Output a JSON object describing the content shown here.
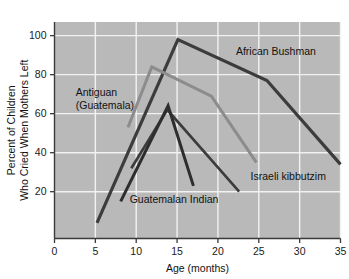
{
  "chart_data": {
    "type": "line",
    "title": "",
    "subtitle": "",
    "xlabel": "Age (months)",
    "ylabel": "Percent of Children\nWho Cried When Mothers Left",
    "ylabel_line1": "Percent of Children",
    "ylabel_line2": "Who Cried When Mothers Left",
    "xlim": [
      0,
      35
    ],
    "ylim": [
      -4,
      107
    ],
    "xticks": [
      0,
      5,
      10,
      15,
      20,
      25,
      30,
      35
    ],
    "xtick_labels": [
      "0",
      "5",
      "10",
      "15",
      "20",
      "25",
      "30",
      "35"
    ],
    "yticks": [
      20,
      40,
      60,
      80,
      100
    ],
    "ytick_labels": [
      "20",
      "40",
      "60",
      "80",
      "100"
    ],
    "grid": true,
    "grid_color": "#f2f2f2",
    "plot_background": "#b9b9b9",
    "legend_position": "inline-annotations",
    "series": [
      {
        "name": "African Bushman",
        "color": "#3c3c3c",
        "width": 3.2,
        "label_x": 22.2,
        "label_y": 90,
        "points": [
          {
            "x": 5.2,
            "y": 4
          },
          {
            "x": 15.1,
            "y": 98
          },
          {
            "x": 26.0,
            "y": 77
          },
          {
            "x": 35.0,
            "y": 34
          }
        ]
      },
      {
        "name": "Antiguan (Guatemala)",
        "color": "#8c8c8c",
        "width": 3.0,
        "label_x": 2.6,
        "label_y": 69,
        "label_line1": "Antiguan",
        "label_line2": "(Guatemala)",
        "points": [
          {
            "x": 9.0,
            "y": 53
          },
          {
            "x": 11.9,
            "y": 84
          },
          {
            "x": 19.2,
            "y": 69
          },
          {
            "x": 24.7,
            "y": 35
          }
        ]
      },
      {
        "name": "Israeli kibbutzim",
        "color": "#3c3c3c",
        "width": 2.6,
        "label_x": 24.0,
        "label_y": 26,
        "points": [
          {
            "x": 9.4,
            "y": 32
          },
          {
            "x": 13.8,
            "y": 62
          },
          {
            "x": 22.6,
            "y": 20
          }
        ]
      },
      {
        "name": "Guatemalan Indian",
        "color": "#2e2e2e",
        "width": 3.0,
        "label_x": 9.2,
        "label_y": 14,
        "points": [
          {
            "x": 8.1,
            "y": 15
          },
          {
            "x": 13.9,
            "y": 64
          },
          {
            "x": 17.0,
            "y": 23
          }
        ]
      }
    ]
  }
}
